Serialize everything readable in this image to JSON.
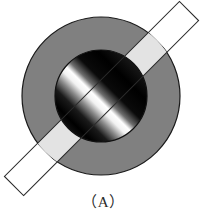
{
  "figure": {
    "caption": "（A）",
    "caption_plain": "(A)",
    "background_color": "#ffffff",
    "outer_disc": {
      "name": "outer-gray-disc",
      "center_x": 101,
      "center_y": 96,
      "radius": 79,
      "fill_color": "#808080",
      "stroke_color": "#1a1a1a",
      "stroke_width": 1.2
    },
    "inner_disc": {
      "name": "inner-gradient-disc",
      "center_x": 101,
      "center_y": 96,
      "radius": 46,
      "stroke_color": "#111111",
      "stroke_width": 1.2,
      "gradient": {
        "type": "linear",
        "angle_deg": 135,
        "stops": [
          {
            "offset": 0.0,
            "color": "#1a1a1a"
          },
          {
            "offset": 0.2,
            "color": "#000000"
          },
          {
            "offset": 0.38,
            "color": "#0a0a0a"
          },
          {
            "offset": 0.48,
            "color": "#6e6e6e"
          },
          {
            "offset": 0.54,
            "color": "#ffffff"
          },
          {
            "offset": 0.6,
            "color": "#f2f2f2"
          },
          {
            "offset": 0.68,
            "color": "#8a8a8a"
          },
          {
            "offset": 0.78,
            "color": "#1a1a1a"
          },
          {
            "offset": 0.9,
            "color": "#000000"
          },
          {
            "offset": 1.0,
            "color": "#141414"
          }
        ]
      }
    },
    "diagonal_bar": {
      "name": "diagonal-white-bar",
      "start_x": 14,
      "start_y": 186,
      "end_x": 189,
      "end_y": 11,
      "width": 27,
      "angle_deg": -45,
      "fill_outside_color": "#ffffff",
      "fill_over_disc_color": "#e3e3e3",
      "stroke_color": "#2b2b2b",
      "stroke_width": 1.1
    }
  }
}
